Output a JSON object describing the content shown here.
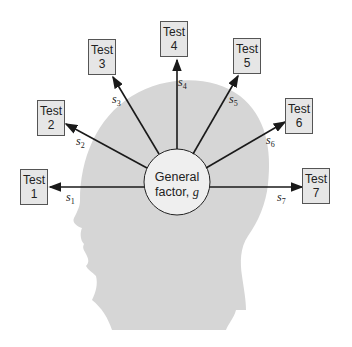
{
  "diagram": {
    "title": "",
    "center": {
      "line1": "General",
      "line2": "factor,",
      "symbol": "g"
    },
    "tests": [
      {
        "label": "Test",
        "number": "1",
        "specific": "s",
        "sub": "1"
      },
      {
        "label": "Test",
        "number": "2",
        "specific": "s",
        "sub": "2"
      },
      {
        "label": "Test",
        "number": "3",
        "specific": "s",
        "sub": "3"
      },
      {
        "label": "Test",
        "number": "4",
        "specific": "s",
        "sub": "4"
      },
      {
        "label": "Test",
        "number": "5",
        "specific": "s",
        "sub": "5"
      },
      {
        "label": "Test",
        "number": "6",
        "specific": "s",
        "sub": "6"
      },
      {
        "label": "Test",
        "number": "7",
        "specific": "s",
        "sub": "7"
      }
    ],
    "colors": {
      "head": "#d6d6d6",
      "box": "#e6e6e6",
      "circle": "#efefef",
      "line": "#1a1a1a"
    }
  }
}
